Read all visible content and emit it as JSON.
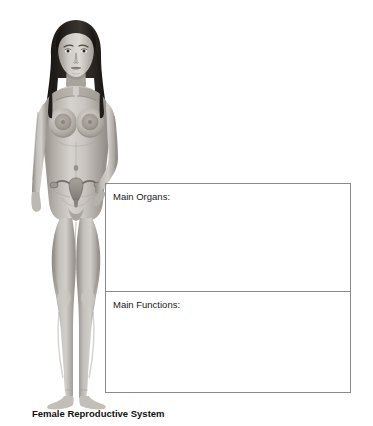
{
  "page": {
    "background_color": "#ffffff",
    "width": 373,
    "height": 426
  },
  "figure": {
    "name": "female-anatomical-figure",
    "hair_color": "#241f1d",
    "skin_base_color": "#b9b4ae",
    "skin_shadow_color": "#8c8781",
    "skin_highlight_color": "#dad6d1",
    "organ_color": "#8e8a85"
  },
  "table": {
    "border_color": "#8a8a8a",
    "rows": [
      {
        "name": "main-organs",
        "label": "Main Organs:",
        "answer": ""
      },
      {
        "name": "main-functions",
        "label": "Main Functions:",
        "answer": ""
      }
    ]
  },
  "caption": {
    "text": "Female Reproductive System"
  }
}
